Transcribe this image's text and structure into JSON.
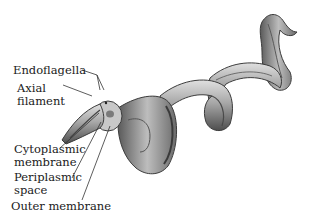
{
  "diagram": {
    "labels": [
      {
        "id": "endoflagella",
        "lines": [
          "Endoflagella"
        ]
      },
      {
        "id": "axial-filament",
        "lines": [
          "Axial",
          "filament"
        ]
      },
      {
        "id": "cytoplasmic-membrane",
        "lines": [
          "Cytoplasmic",
          "membrane"
        ]
      },
      {
        "id": "periplasmic-space",
        "lines": [
          "Periplasmic",
          "space"
        ]
      },
      {
        "id": "outer-membrane",
        "lines": [
          "Outer membrane"
        ]
      }
    ],
    "colors": {
      "background": "#ffffff",
      "body_dark": "#4a4a4a",
      "body_mid": "#8c8c8c",
      "body_light": "#d6d6d6",
      "leader_lines": "#333333",
      "text": "#1a1a1a"
    }
  }
}
